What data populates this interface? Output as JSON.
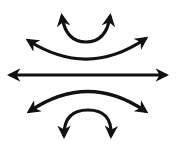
{
  "figure": {
    "title": "",
    "stroke_color": "#111111",
    "background_color": "#ffffff",
    "arrows": [
      {
        "name": "top-small-arc-arrow",
        "type": "arc-up",
        "icon": "double-headed-curved-arrow"
      },
      {
        "name": "top-wide-arc-arrow",
        "type": "arc-up",
        "icon": "double-headed-curved-arrow"
      },
      {
        "name": "center-horizontal-arrow",
        "type": "straight",
        "icon": "double-headed-arrow"
      },
      {
        "name": "bottom-wide-arc-arrow",
        "type": "arc-down",
        "icon": "double-headed-curved-arrow"
      },
      {
        "name": "bottom-small-arc-arrow",
        "type": "arc-down",
        "icon": "double-headed-curved-arrow"
      }
    ]
  }
}
